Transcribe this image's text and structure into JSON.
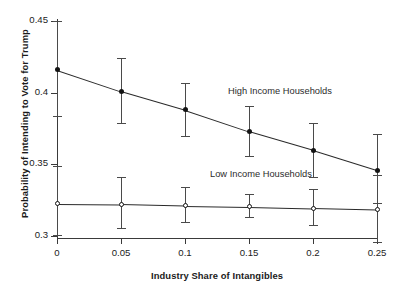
{
  "chart_data": {
    "type": "line",
    "title": "",
    "subtitle": "",
    "xlabel": "Industry Share of Intangibles",
    "ylabel": "Probability of Intending to Vote for Trump",
    "x": [
      0,
      0.05,
      0.1,
      0.15,
      0.2,
      0.25
    ],
    "xtick_labels": [
      "0",
      "0.05",
      "0.1",
      "0.15",
      "0.2",
      "0.25"
    ],
    "ytick_labels": [
      "0.3",
      "0.35",
      "0.4",
      "0.45"
    ],
    "yticks": [
      0.3,
      0.35,
      0.4,
      0.45
    ],
    "xlim": [
      0,
      0.25
    ],
    "ylim": [
      0.285,
      0.453
    ],
    "grid": false,
    "legend_position": "inline-annotations",
    "series": [
      {
        "name": "High Income Households",
        "values": [
          0.416,
          0.401,
          0.388,
          0.373,
          0.36,
          0.346
        ],
        "ci_low": [
          0.384,
          0.379,
          0.37,
          0.356,
          0.341,
          0.323
        ],
        "ci_high": [
          0.45,
          0.424,
          0.407,
          0.391,
          0.379,
          0.371
        ],
        "marker": "filled-circle",
        "color": "#141414"
      },
      {
        "name": "Low Income Households",
        "values": [
          0.3225,
          0.3222,
          0.3212,
          0.3205,
          0.3195,
          0.3185
        ],
        "ci_low": [
          0.3005,
          0.3055,
          0.31,
          0.3135,
          0.308,
          0.2955
        ],
        "ci_high": [
          0.349,
          0.3415,
          0.3345,
          0.3295,
          0.333,
          0.3425
        ],
        "marker": "open-circle",
        "color": "#3a3a3a"
      }
    ],
    "annotations": [
      {
        "text": "High Income Households",
        "x": 0.135,
        "y": 0.4095
      },
      {
        "text": "Low Income Households",
        "x": 0.12,
        "y": 0.3515
      }
    ],
    "colors": {
      "axis": "#3a3a3a",
      "text": "#1b1b1b",
      "line": "#2a2a2a",
      "errorbar": "#4a4a4a"
    }
  }
}
